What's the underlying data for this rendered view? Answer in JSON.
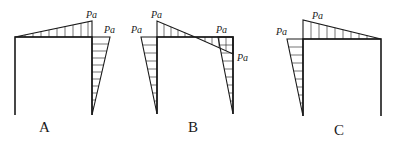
{
  "figure": {
    "options": [
      {
        "id": "A",
        "caption": "A",
        "labels": [
          {
            "text": "Pa",
            "position": "beam-right-peak"
          },
          {
            "text": "Pa",
            "position": "right-column-top"
          }
        ]
      },
      {
        "id": "B",
        "caption": "B",
        "labels": [
          {
            "text": "Pa",
            "position": "left-column-top-outside"
          },
          {
            "text": "Pa",
            "position": "beam-left-peak"
          },
          {
            "text": "Pa",
            "position": "right-column-top-outside"
          },
          {
            "text": "Pa",
            "position": "beam-right-below"
          }
        ]
      },
      {
        "id": "C",
        "caption": "C",
        "labels": [
          {
            "text": "Pa",
            "position": "left-column-top-outside"
          },
          {
            "text": "Pa",
            "position": "beam-left-peak"
          }
        ]
      }
    ]
  }
}
